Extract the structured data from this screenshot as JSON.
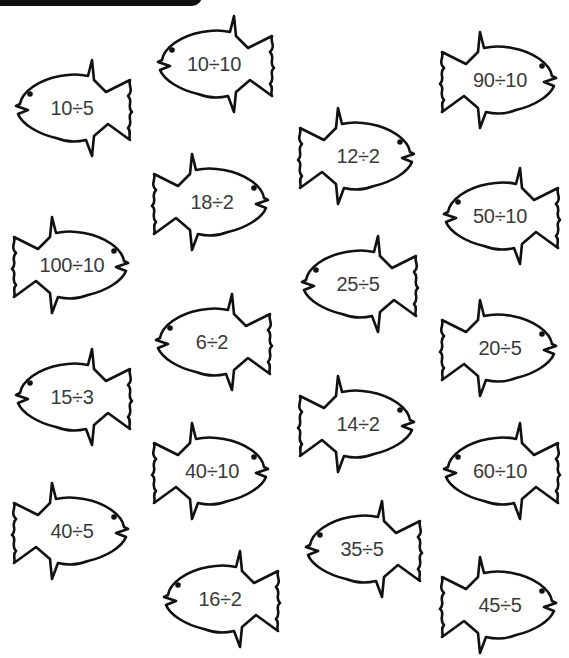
{
  "worksheet": {
    "header_bar_color": "#111111",
    "outline_color": "#111111",
    "text_color": "#3a3a3a",
    "fish": [
      {
        "label": "10÷5",
        "x": 8,
        "y": 58,
        "facing": "left"
      },
      {
        "label": "10÷10",
        "x": 150,
        "y": 14,
        "facing": "left"
      },
      {
        "label": "90÷10",
        "x": 436,
        "y": 30,
        "facing": "right"
      },
      {
        "label": "12÷2",
        "x": 294,
        "y": 106,
        "facing": "right"
      },
      {
        "label": "18÷2",
        "x": 148,
        "y": 152,
        "facing": "right"
      },
      {
        "label": "50÷10",
        "x": 436,
        "y": 166,
        "facing": "left"
      },
      {
        "label": "100÷10",
        "x": 8,
        "y": 215,
        "facing": "right"
      },
      {
        "label": "25÷5",
        "x": 294,
        "y": 234,
        "facing": "left"
      },
      {
        "label": "6÷2",
        "x": 148,
        "y": 292,
        "facing": "left"
      },
      {
        "label": "20÷5",
        "x": 436,
        "y": 298,
        "facing": "right"
      },
      {
        "label": "15÷3",
        "x": 8,
        "y": 347,
        "facing": "left"
      },
      {
        "label": "14÷2",
        "x": 294,
        "y": 374,
        "facing": "right"
      },
      {
        "label": "40÷10",
        "x": 148,
        "y": 421,
        "facing": "right"
      },
      {
        "label": "60÷10",
        "x": 436,
        "y": 421,
        "facing": "left"
      },
      {
        "label": "40÷5",
        "x": 8,
        "y": 481,
        "facing": "right"
      },
      {
        "label": "35÷5",
        "x": 298,
        "y": 499,
        "facing": "left"
      },
      {
        "label": "16÷2",
        "x": 156,
        "y": 549,
        "facing": "left"
      },
      {
        "label": "45÷5",
        "x": 436,
        "y": 555,
        "facing": "right"
      }
    ]
  }
}
